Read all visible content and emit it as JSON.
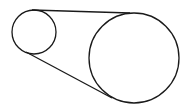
{
  "diagram": {
    "type": "belt-pulley",
    "stroke_color": "#1a1a1a",
    "background": "#ffffff",
    "small_pulley": {
      "cx": 34,
      "cy": 32,
      "r": 22
    },
    "large_pulley": {
      "cx": 134,
      "cy": 58,
      "r": 45
    },
    "belt_top": {
      "x1": 32,
      "y1": 10,
      "x2": 130,
      "y2": 13
    },
    "belt_bottom": {
      "x1": 26,
      "y1": 52,
      "x2": 112,
      "y2": 98
    }
  }
}
